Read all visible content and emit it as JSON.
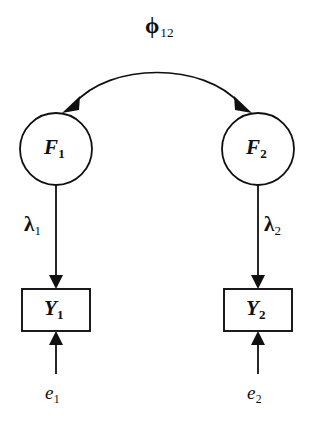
{
  "figure": {
    "type": "sem-path-diagram",
    "background_color": "#ffffff",
    "stroke_color": "#101010",
    "width": 316,
    "height": 431
  },
  "nodes": {
    "latent_factors": [
      {
        "id": "F1",
        "label": "F",
        "subscript": "1",
        "shape": "circle",
        "cx": 56,
        "cy": 149,
        "r": 36
      },
      {
        "id": "F2",
        "label": "F",
        "subscript": "2",
        "shape": "circle",
        "cx": 258,
        "cy": 149,
        "r": 36
      }
    ],
    "observed_variables": [
      {
        "id": "Y1",
        "label": "Y",
        "subscript": "1",
        "shape": "rectangle",
        "x": 22,
        "y": 289,
        "width": 68,
        "height": 42
      },
      {
        "id": "Y2",
        "label": "Y",
        "subscript": "2",
        "shape": "rectangle",
        "x": 224,
        "y": 289,
        "width": 68,
        "height": 42
      }
    ],
    "errors": [
      {
        "id": "e1",
        "label": "e",
        "subscript": "1",
        "x": 56,
        "y": 392
      },
      {
        "id": "e2",
        "label": "e",
        "subscript": "2",
        "x": 258,
        "y": 392
      }
    ]
  },
  "edges": {
    "covariance": {
      "id": "phi12",
      "label": "ϕ",
      "subscript": "12",
      "from": "F1",
      "to": "F2",
      "style": "curved-double-headed-arrow",
      "arrowheads": "both"
    },
    "loadings": [
      {
        "id": "lambda1",
        "label": "λ",
        "subscript": "1",
        "from": "F1",
        "to": "Y1",
        "style": "straight-arrow",
        "label_side": "left"
      },
      {
        "id": "lambda2",
        "label": "λ",
        "subscript": "2",
        "from": "F2",
        "to": "Y2",
        "style": "straight-arrow",
        "label_side": "right"
      }
    ],
    "residuals": [
      {
        "id": "e1-path",
        "from": "e1",
        "to": "Y1",
        "style": "straight-arrow-up"
      },
      {
        "id": "e2-path",
        "from": "e2",
        "to": "Y2",
        "style": "straight-arrow-up"
      }
    ]
  },
  "labels": {
    "phi12": {
      "glyph": "ϕ",
      "subscript": "12"
    },
    "f1": {
      "glyph": "F",
      "subscript": "1"
    },
    "f2": {
      "glyph": "F",
      "subscript": "2"
    },
    "lambda1": {
      "glyph": "λ",
      "subscript": "1"
    },
    "lambda2": {
      "glyph": "λ",
      "subscript": "2"
    },
    "y1": {
      "glyph": "Y",
      "subscript": "1"
    },
    "y2": {
      "glyph": "Y",
      "subscript": "2"
    },
    "e1": {
      "glyph": "e",
      "subscript": "1"
    },
    "e2": {
      "glyph": "e",
      "subscript": "2"
    }
  }
}
